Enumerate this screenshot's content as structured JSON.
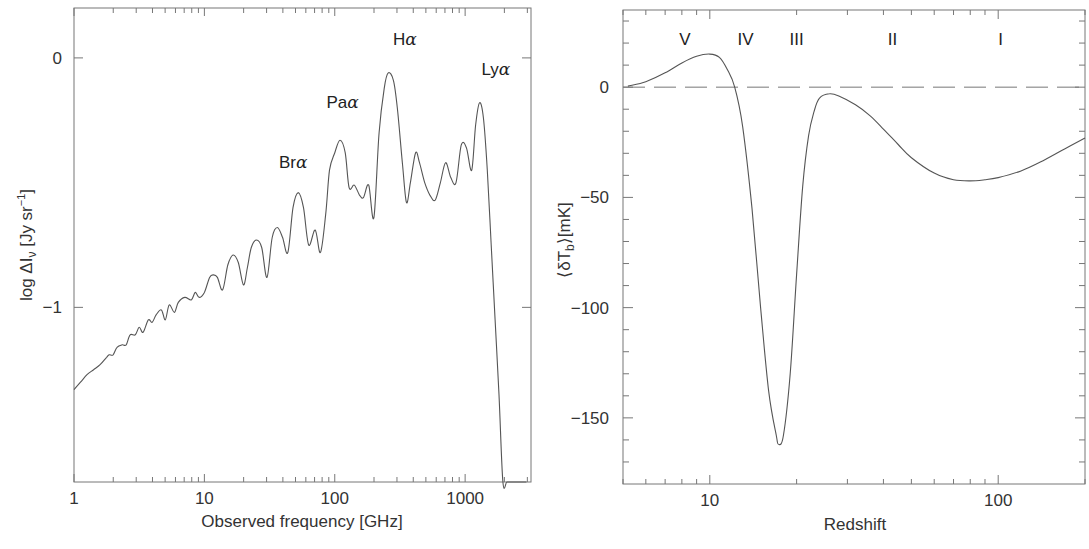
{
  "chart_data": [
    {
      "type": "line",
      "id": "left",
      "title": "",
      "xlabel": "Observed frequency [GHz]",
      "ylabel": "log ΔI_ν [Jy sr^-1]",
      "xscale": "log",
      "xlim": [
        1,
        3200
      ],
      "ylim": [
        -1.7,
        0.2
      ],
      "xticks": [
        {
          "value": 1,
          "label": "1"
        },
        {
          "value": 10,
          "label": "10"
        },
        {
          "value": 100,
          "label": "100"
        },
        {
          "value": 1000,
          "label": "1000"
        }
      ],
      "yticks": [
        {
          "value": 0,
          "label": "0"
        },
        {
          "value": -1,
          "label": "−1"
        }
      ],
      "grid": false,
      "annotations": [
        {
          "text": "Br",
          "greek": "α",
          "x": 48,
          "y": -0.44
        },
        {
          "text": "Pa",
          "greek": "α",
          "x": 115,
          "y": -0.2
        },
        {
          "text": "H",
          "greek": "α",
          "x": 345,
          "y": 0.05
        },
        {
          "text": "Ly",
          "greek": "α",
          "x": 1720,
          "y": -0.07
        }
      ],
      "series": [
        {
          "name": "spectrum",
          "log_x": [
            0.0,
            0.05,
            0.1,
            0.15,
            0.2,
            0.25,
            0.27,
            0.3,
            0.33,
            0.37,
            0.4,
            0.43,
            0.47,
            0.5,
            0.53,
            0.57,
            0.6,
            0.63,
            0.67,
            0.7,
            0.73,
            0.77,
            0.8,
            0.85,
            0.9,
            0.93,
            0.96,
            1.0,
            1.04,
            1.07,
            1.1,
            1.14,
            1.18,
            1.22,
            1.26,
            1.3,
            1.33,
            1.36,
            1.4,
            1.44,
            1.48,
            1.52,
            1.56,
            1.6,
            1.64,
            1.68,
            1.72,
            1.76,
            1.8,
            1.85,
            1.89,
            1.93,
            1.96,
            2.0,
            2.04,
            2.08,
            2.11,
            2.15,
            2.19,
            2.22,
            2.26,
            2.3,
            2.34,
            2.38,
            2.41,
            2.45,
            2.48,
            2.52,
            2.55,
            2.58,
            2.62,
            2.65,
            2.69,
            2.73,
            2.77,
            2.81,
            2.85,
            2.89,
            2.93,
            2.97,
            3.01,
            3.05,
            3.08,
            3.11,
            3.14,
            3.17,
            3.2,
            3.23,
            3.26,
            3.29,
            3.32,
            3.36,
            3.4,
            3.44,
            3.47
          ],
          "values": [
            -1.33,
            -1.3,
            -1.27,
            -1.25,
            -1.23,
            -1.2,
            -1.19,
            -1.19,
            -1.16,
            -1.15,
            -1.15,
            -1.11,
            -1.11,
            -1.08,
            -1.1,
            -1.05,
            -1.06,
            -1.03,
            -1.01,
            -1.05,
            -0.99,
            -1.02,
            -0.98,
            -0.96,
            -0.97,
            -0.94,
            -0.96,
            -0.94,
            -0.88,
            -0.87,
            -0.88,
            -0.93,
            -0.83,
            -0.79,
            -0.82,
            -0.91,
            -0.84,
            -0.76,
            -0.73,
            -0.76,
            -0.88,
            -0.72,
            -0.68,
            -0.72,
            -0.78,
            -0.6,
            -0.54,
            -0.6,
            -0.75,
            -0.69,
            -0.78,
            -0.63,
            -0.45,
            -0.38,
            -0.33,
            -0.38,
            -0.52,
            -0.51,
            -0.55,
            -0.56,
            -0.51,
            -0.64,
            -0.3,
            -0.12,
            -0.06,
            -0.09,
            -0.2,
            -0.43,
            -0.58,
            -0.5,
            -0.38,
            -0.42,
            -0.5,
            -0.55,
            -0.57,
            -0.5,
            -0.42,
            -0.48,
            -0.5,
            -0.35,
            -0.36,
            -0.45,
            -0.27,
            -0.18,
            -0.24,
            -0.45,
            -0.75,
            -1.05,
            -1.35,
            -1.7,
            -1.8,
            -1.8,
            -1.8,
            -1.8,
            -1.8
          ]
        }
      ]
    },
    {
      "type": "line",
      "id": "right",
      "title": "",
      "xlabel": "Redshift",
      "ylabel": "⟨δT_b⟩[mK]",
      "xscale": "log",
      "xlim": [
        5,
        200
      ],
      "ylim": [
        -180,
        35
      ],
      "xticks": [
        {
          "value": 10,
          "label": "10"
        },
        {
          "value": 100,
          "label": "100"
        }
      ],
      "yticks": [
        {
          "value": 0,
          "label": "0"
        },
        {
          "value": -50,
          "label": "−50"
        },
        {
          "value": -100,
          "label": "−100"
        },
        {
          "value": -150,
          "label": "−150"
        }
      ],
      "grid": false,
      "reference_line": {
        "y": 0,
        "style": "dashed"
      },
      "regions": [
        {
          "label": "V",
          "x": 8.2
        },
        {
          "label": "IV",
          "x": 13.3
        },
        {
          "label": "III",
          "x": 20
        },
        {
          "label": "II",
          "x": 43
        },
        {
          "label": "I",
          "x": 102
        }
      ],
      "series": [
        {
          "name": "global 21-cm signal",
          "x": [
            5.2,
            6,
            7,
            8,
            9,
            10,
            10.8,
            11.5,
            12.2,
            13,
            14,
            15,
            16,
            17,
            17.3,
            18,
            19,
            20,
            21,
            22,
            23,
            24,
            26,
            28,
            32,
            36,
            40,
            45,
            50,
            60,
            70,
            80,
            90,
            100,
            120,
            140,
            170,
            200
          ],
          "values": [
            0.5,
            2.5,
            6.5,
            11,
            14,
            15,
            13.5,
            8,
            0,
            -18,
            -55,
            -100,
            -138,
            -158,
            -162,
            -158,
            -130,
            -85,
            -45,
            -22,
            -11,
            -5,
            -3,
            -4,
            -8,
            -13,
            -19,
            -26,
            -32,
            -39,
            -42,
            -42.5,
            -42,
            -41,
            -38,
            -34,
            -28,
            -23
          ]
        }
      ]
    }
  ]
}
